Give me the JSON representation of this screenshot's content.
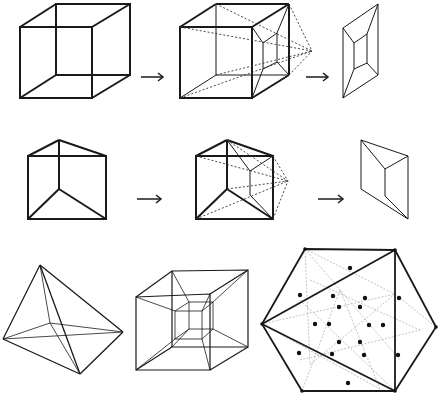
{
  "figure": {
    "rows": [
      {
        "name": "cube-row",
        "panels": [
          {
            "name": "cube",
            "label": "Cube (wireframe)"
          },
          {
            "name": "cube-projection",
            "label": "Cube projected from a point"
          },
          {
            "name": "cube-shadow",
            "label": "Projected image of cube"
          }
        ]
      },
      {
        "name": "prism-row",
        "panels": [
          {
            "name": "triangular-prism",
            "label": "Triangular prism"
          },
          {
            "name": "prism-projection",
            "label": "Prism projected from a point"
          },
          {
            "name": "prism-shadow",
            "label": "Projected image of prism"
          }
        ]
      },
      {
        "name": "4d-row",
        "panels": [
          {
            "name": "simplex-projection",
            "label": "5-cell projection"
          },
          {
            "name": "tesseract-projection",
            "label": "Tesseract projection"
          },
          {
            "name": "600cell-projection",
            "label": "Polytope projection with vertices"
          }
        ]
      }
    ],
    "arrow_glyph": "→",
    "colors": {
      "line": "#1a1a1a",
      "dotted": "#333333",
      "light": "#9a9a9a",
      "dot": "#111111",
      "background": "#ffffff"
    }
  }
}
